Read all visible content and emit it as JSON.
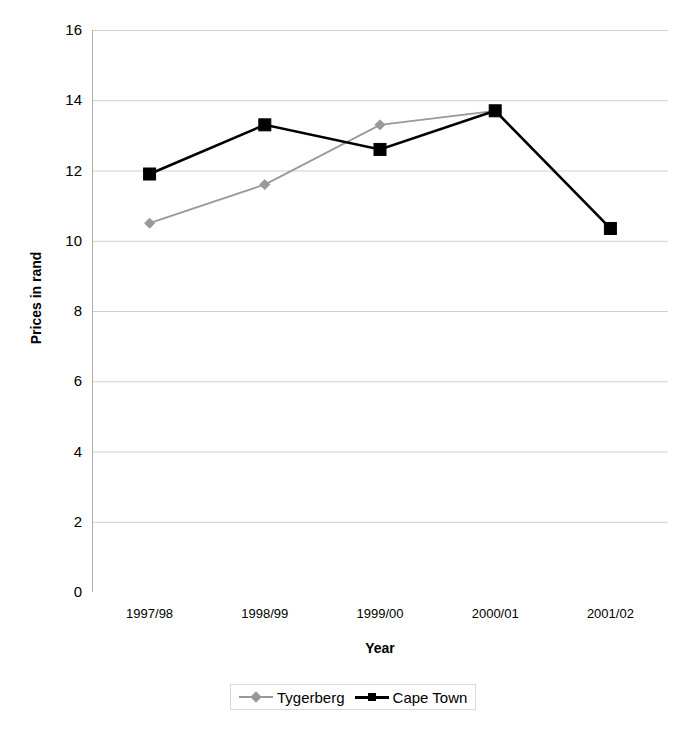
{
  "chart_data": {
    "type": "line",
    "title": "",
    "xlabel": "Year",
    "ylabel": "Prices in rand",
    "categories": [
      "1997/98",
      "1998/99",
      "1999/00",
      "2000/01",
      "2001/02"
    ],
    "ylim": [
      0,
      16
    ],
    "ytick_step": 2,
    "yticks": [
      "16",
      "14",
      "12",
      "10",
      "8",
      "6",
      "4",
      "2",
      "0"
    ],
    "grid": "horizontal",
    "legend_position": "bottom",
    "series": [
      {
        "name": "Tygerberg",
        "color": "#999999",
        "marker": "diamond",
        "values": [
          10.5,
          11.6,
          13.3,
          13.7,
          null
        ]
      },
      {
        "name": "Cape Town",
        "color": "#000000",
        "marker": "square",
        "values": [
          11.9,
          13.3,
          12.6,
          13.7,
          10.35
        ]
      }
    ]
  },
  "axis": {
    "y_title": "Prices in rand",
    "x_title": "Year"
  },
  "colors": {
    "grid": "#d0d0d0",
    "axis": "#b0b0b0",
    "series_tygerberg": "#999999",
    "series_cape_town": "#000000",
    "legend_border": "#d9d9d9",
    "background": "#ffffff"
  }
}
